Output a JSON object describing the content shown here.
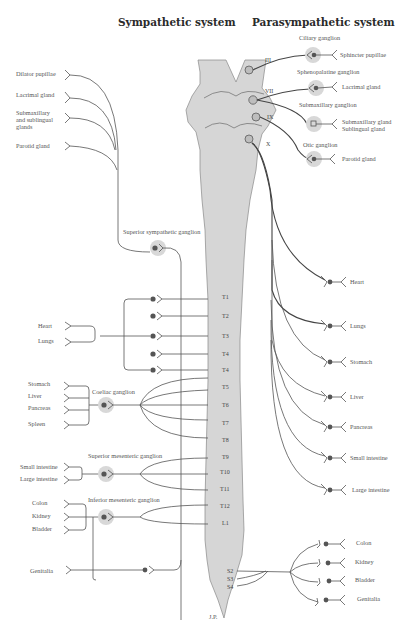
{
  "titles": {
    "sympathetic": "Sympathetic system",
    "parasympathetic": "Parasympathetic system"
  },
  "sympathetic": {
    "head_targets": [
      "Dilator pupillae",
      "Lacrimal gland",
      "Submaxillary",
      "and sublingual",
      "glands",
      "Parotid gland"
    ],
    "superior_ganglion": "Superior sympathetic ganglion",
    "thoracic_targets": [
      "Heart",
      "Lungs"
    ],
    "celiac_targets": [
      "Stomach",
      "Liver",
      "Pancreas",
      "Spleen"
    ],
    "celiac_ganglion": "Coeliac ganglion",
    "superior_mesenteric_ganglion": "Superior mesenteric ganglion",
    "sup_mes_targets": [
      "Small intestine",
      "Large intestine"
    ],
    "inferior_mesenteric_ganglion": "Inferior mesenteric ganglion",
    "inf_mes_targets": [
      "Colon",
      "Kidney",
      "Bladder"
    ],
    "genitalia": "Genitalia"
  },
  "cord": {
    "cranial_nerves": [
      "III",
      "VII",
      "IX",
      "X"
    ],
    "segments": [
      "T1",
      "T2",
      "T3",
      "T4",
      "T4",
      "T5",
      "T6",
      "T7",
      "T8",
      "T9",
      "T10",
      "T11",
      "T12",
      "L1"
    ],
    "sacral": [
      "S2",
      "S3",
      "S4"
    ]
  },
  "parasympathetic": {
    "ciliary_ganglion": "Ciliary ganglion",
    "sphincter": "Sphincter pupillae",
    "sphenopalatine_ganglion": "Sphenopalatine ganglion",
    "lacrimal": "Lacrimal gland",
    "submaxillary_ganglion": "Submaxillary ganglion",
    "submaxillary_gland": "Submaxillary gland",
    "sublingual_gland": "Sublingual gland",
    "otic_ganglion": "Otic ganglion",
    "parotid": "Parotid gland",
    "vagus_targets": [
      "Heart",
      "Lungs",
      "Stomach",
      "Liver",
      "Pancreas",
      "Small intestine",
      "Large intestine"
    ],
    "sacral_targets": [
      "Colon",
      "Kidney",
      "Bladder",
      "Genitalia"
    ]
  },
  "signature": "J.P."
}
